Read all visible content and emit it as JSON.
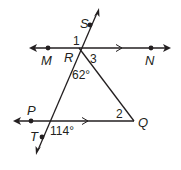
{
  "diagram": {
    "points": {
      "S": {
        "label": "S"
      },
      "M": {
        "label": "M"
      },
      "R": {
        "label": "R"
      },
      "N": {
        "label": "N"
      },
      "P": {
        "label": "P"
      },
      "T": {
        "label": "T"
      },
      "Q": {
        "label": "Q"
      }
    },
    "angles": {
      "angle1": "1",
      "angle2": "2",
      "angle3": "3",
      "angleR": "62°",
      "angleT": "114°"
    },
    "colors": {
      "ink": "#231f20",
      "background": "#ffffff"
    }
  }
}
